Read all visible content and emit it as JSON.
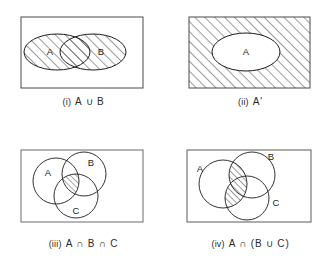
{
  "document": {
    "title": "Venn diagrams for set operations",
    "background_color": "#ffffff",
    "ink_color": "#1c1c1c",
    "hatch_color": "#3a3a3a"
  },
  "panels": [
    {
      "id": "panel-i",
      "number": "(i)",
      "expression": "A ∪ B",
      "caption": "(i)  A ∪ B",
      "universe_shape": "rectangle",
      "sets": [
        {
          "label": "A",
          "shape": "ellipse",
          "shaded": true
        },
        {
          "label": "B",
          "shape": "ellipse",
          "shaded": true
        }
      ],
      "shaded_region": "union of A and B",
      "hatch_direction": "45deg-up-right"
    },
    {
      "id": "panel-ii",
      "number": "(ii)",
      "expression": "A′",
      "caption": "(ii)  A′",
      "universe_shape": "rectangle",
      "sets": [
        {
          "label": "A",
          "shape": "ellipse",
          "shaded": false
        }
      ],
      "shaded_region": "complement of A (everything outside A)",
      "hatch_direction": "45deg-up-right"
    },
    {
      "id": "panel-iii",
      "number": "(iii)",
      "expression": "A ∩ B ∩ C",
      "caption": "(iii)  A ∩ B ∩ C",
      "universe_shape": "rectangle",
      "sets": [
        {
          "label": "A",
          "shape": "circle",
          "shaded": false
        },
        {
          "label": "B",
          "shape": "circle",
          "shaded": false
        },
        {
          "label": "C",
          "shape": "circle",
          "shaded": false
        }
      ],
      "shaded_region": "central triple intersection of A, B and C",
      "hatch_direction": "45deg-up-right"
    },
    {
      "id": "panel-iv",
      "number": "(iv)",
      "expression": "A ∩ (B ∪ C)",
      "caption": "(iv)  A ∩ (B ∪ C)",
      "universe_shape": "rectangle",
      "sets": [
        {
          "label": "A",
          "shape": "circle",
          "shaded": false
        },
        {
          "label": "B",
          "shape": "circle",
          "shaded": false
        },
        {
          "label": "C",
          "shape": "circle",
          "shaded": false
        }
      ],
      "shaded_region": "part of A that lies inside B or C",
      "hatch_direction": "45deg-up-right"
    }
  ]
}
